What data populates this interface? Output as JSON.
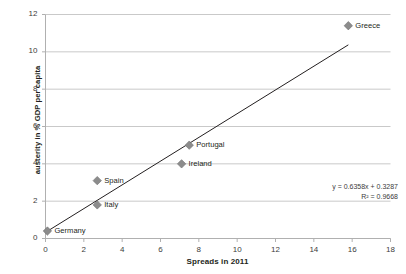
{
  "chart_data": {
    "type": "scatter",
    "title": "",
    "xlabel": "Spreads in 2011",
    "ylabel": "austerity in % GDP per capita",
    "xlim": [
      0,
      18
    ],
    "ylim": [
      0,
      12
    ],
    "xticks": [
      0,
      2,
      4,
      6,
      8,
      10,
      12,
      14,
      16,
      18
    ],
    "yticks": [
      0,
      2,
      4,
      6,
      8,
      10,
      12
    ],
    "grid": "horizontal",
    "legend": "none",
    "marker_shape": "diamond",
    "marker_color": "#8c8c8c",
    "trendline_color": "#231f20",
    "points": [
      {
        "label": "Germany",
        "x": 0.1,
        "y": 0.4
      },
      {
        "label": "Italy",
        "x": 2.7,
        "y": 1.8
      },
      {
        "label": "Spain",
        "x": 2.7,
        "y": 3.1
      },
      {
        "label": "Ireland",
        "x": 7.1,
        "y": 4.0
      },
      {
        "label": "Portugal",
        "x": 7.5,
        "y": 5.0
      },
      {
        "label": "Greece",
        "x": 15.8,
        "y": 11.4
      }
    ],
    "trendline": {
      "slope": 0.6358,
      "intercept": 0.3287,
      "x_start": 0.1,
      "x_end": 15.8
    },
    "annotations": {
      "equation": "y = 0.6358x + 0.3287",
      "r_squared": "R² = 0.9668"
    }
  }
}
